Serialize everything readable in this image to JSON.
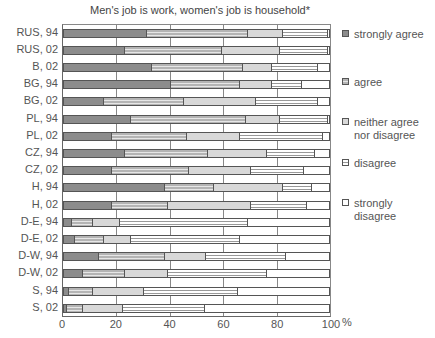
{
  "chart_data": {
    "type": "bar",
    "orientation": "horizontal",
    "stacked": true,
    "title": "Men's job is work, women's job is  household*",
    "xlabel": "%",
    "ylabel": "",
    "xlim": [
      0,
      100
    ],
    "xticks": [
      0,
      20,
      40,
      60,
      80,
      100
    ],
    "grid": true,
    "legend_position": "right",
    "categories": [
      "RUS, 94",
      "RUS, 02",
      "B, 02",
      "BG, 94",
      "BG, 02",
      "PL, 94",
      "PL, 02",
      "CZ, 94",
      "CZ, 02",
      "H, 94",
      "H, 02",
      "D-E, 94",
      "D-E, 02",
      "D-W, 94",
      "D-W, 02",
      "S, 94",
      "S, 02"
    ],
    "series": [
      {
        "name": "strongly agree",
        "color": "#8c8c8c",
        "values": [
          31,
          23,
          33,
          40,
          15,
          25,
          18,
          23,
          18,
          38,
          18,
          3,
          4,
          13,
          7,
          2,
          1
        ]
      },
      {
        "name": "agree",
        "color": "#b4b4b4",
        "values": [
          38,
          36,
          34,
          26,
          30,
          43,
          28,
          31,
          29,
          18,
          21,
          8,
          11,
          25,
          16,
          9,
          6
        ]
      },
      {
        "name": "neither agree nor disagree",
        "color": "#d8d8d8",
        "values": [
          13,
          22,
          11,
          12,
          27,
          13,
          20,
          22,
          23,
          26,
          31,
          10,
          10,
          15,
          16,
          19,
          15
        ]
      },
      {
        "name": "disagree",
        "color": "#e0e0e0",
        "values": [
          17,
          18,
          17,
          11,
          23,
          18,
          31,
          18,
          20,
          11,
          21,
          48,
          41,
          30,
          37,
          35,
          31
        ]
      },
      {
        "name": "strongly disagree",
        "color": "#ffffff",
        "values": [
          1,
          1,
          5,
          11,
          5,
          1,
          3,
          6,
          10,
          7,
          9,
          31,
          34,
          17,
          24,
          35,
          47
        ]
      }
    ]
  },
  "legend": [
    {
      "label": "strongly agree"
    },
    {
      "label": "agree"
    },
    {
      "label": "neither agree\nnor disagree"
    },
    {
      "label": "disagree"
    },
    {
      "label": "strongly\ndisagree"
    }
  ],
  "axis": {
    "ticks": [
      "0",
      "20",
      "40",
      "60",
      "80",
      "100"
    ],
    "unit": "%"
  }
}
